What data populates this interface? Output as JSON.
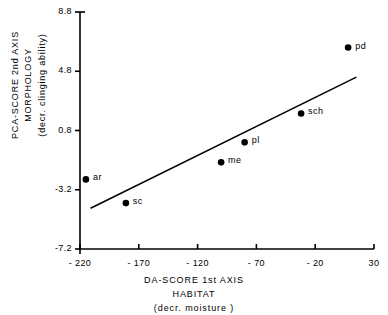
{
  "chart_data": {
    "type": "scatter",
    "title": "",
    "xlabel": "DA-SCORE 1st AXIS",
    "xlabel_line2": "HABITAT",
    "xlabel_line3": "(decr. moisture )",
    "ylabel": "PCA-SCORE 2nd AXIS",
    "ylabel_line2": "MORPHOLOGY",
    "ylabel_line3": "(decr. clinging ability)",
    "xlim": [
      -220,
      30
    ],
    "ylim": [
      -7.2,
      8.8
    ],
    "xticks": [
      "- 220",
      "- 170",
      "- 120",
      "- 70",
      "- 20",
      "30"
    ],
    "xtick_values": [
      -220,
      -170,
      -120,
      -70,
      -20,
      30
    ],
    "yticks": [
      "8.8",
      "4.8",
      "0.8",
      "-3.2",
      "-7.2"
    ],
    "ytick_values": [
      8.8,
      4.8,
      0.8,
      -3.2,
      -7.2
    ],
    "grid": false,
    "legend": "none",
    "marker_color": "#000000",
    "line_color": "#000000",
    "axis_color": "#000000",
    "points": [
      {
        "label": "ar",
        "x": -215,
        "y": -2.5,
        "label_dx": 7,
        "label_dy": -4
      },
      {
        "label": "sc",
        "x": -181,
        "y": -4.1,
        "label_dx": 7,
        "label_dy": -4
      },
      {
        "label": "me",
        "x": -100,
        "y": -1.35,
        "label_dx": 7,
        "label_dy": -4
      },
      {
        "label": "pl",
        "x": -80,
        "y": 0.0,
        "label_dx": 7,
        "label_dy": -4
      },
      {
        "label": "sch",
        "x": -32,
        "y": 1.95,
        "label_dx": 7,
        "label_dy": -4
      },
      {
        "label": "pd",
        "x": 8,
        "y": 6.4,
        "label_dx": 7,
        "label_dy": -4
      }
    ],
    "trendline": {
      "x0": -211,
      "y0": -4.45,
      "x1": 15,
      "y1": 4.4
    }
  }
}
